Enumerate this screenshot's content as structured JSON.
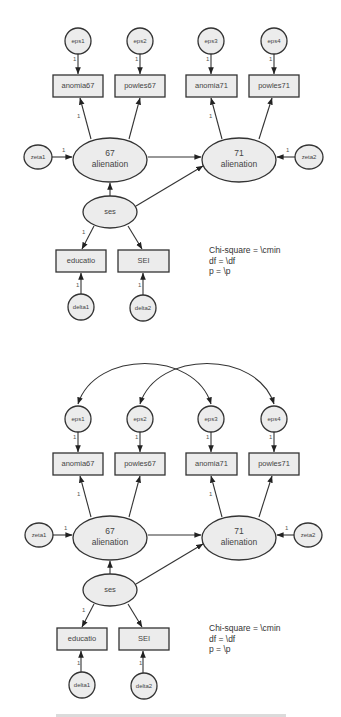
{
  "diagrams": [
    {
      "id": "model-1",
      "y_offset": 0,
      "has_error_covariances": false
    },
    {
      "id": "model-2",
      "y_offset": 378,
      "has_error_covariances": true
    }
  ],
  "nodes": {
    "eps1": "eps1",
    "eps2": "eps2",
    "eps3": "eps3",
    "eps4": "eps4",
    "anomia67": "anomia67",
    "powles67": "powles67",
    "anomia71": "anomia71",
    "powles71": "powles71",
    "zeta1": "zeta1",
    "zeta2": "zeta2",
    "alienation67_line1": "67",
    "alienation67_line2": "alienation",
    "alienation71_line1": "71",
    "alienation71_line2": "alienation",
    "ses": "ses",
    "educatio": "educatio",
    "SEI": "SEI",
    "delta1": "delta1",
    "delta2": "delta2"
  },
  "path_weight_label": "1",
  "fit_text": {
    "line1": "Chi-square = \\cmin",
    "line2": "df = \\df",
    "line3": "p = \\p"
  },
  "colors": {
    "node_fill": "#ececec",
    "stroke": "#333333",
    "text": "#444444"
  }
}
